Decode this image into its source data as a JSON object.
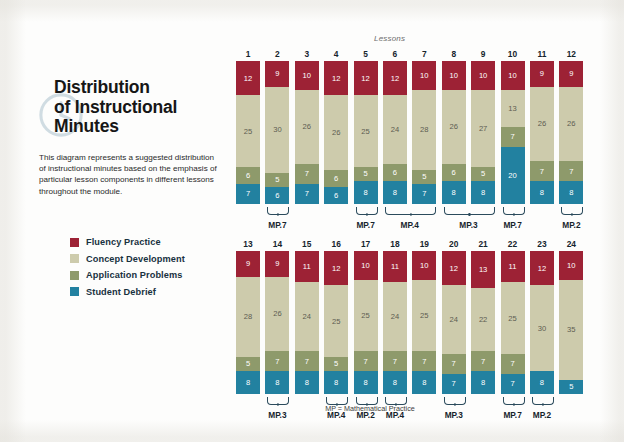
{
  "header": {
    "title_lines": [
      "Distribution",
      "of Instructional",
      "Minutes"
    ],
    "intro": "This diagram represents a suggested distribution of instructional minutes based on the emphasis of particular lesson components in different lessons throughout the module.",
    "clock_icon": "clock-icon"
  },
  "legend": {
    "items": [
      {
        "label": "Fluency Practice",
        "color": "#9d2235"
      },
      {
        "label": "Concept Development",
        "color": "#cdcbac"
      },
      {
        "label": "Application Problems",
        "color": "#8e9a6b"
      },
      {
        "label": "Student Debrief",
        "color": "#2281a0"
      }
    ]
  },
  "chart_data": {
    "type": "bar",
    "title": "Distribution of Instructional Minutes",
    "subtitle": "Lessons",
    "stacked": true,
    "xlabel": "Lessons",
    "ylabel": "Instructional minutes",
    "ylim": [
      0,
      50
    ],
    "grid": false,
    "legend_position": "left",
    "categories": [
      "1",
      "2",
      "3",
      "4",
      "5",
      "6",
      "7",
      "8",
      "9",
      "10",
      "11",
      "12",
      "13",
      "14",
      "15",
      "16",
      "17",
      "18",
      "19",
      "20",
      "21",
      "22",
      "23",
      "24"
    ],
    "series": [
      {
        "name": "Fluency Practice",
        "color": "#9d2235",
        "values": [
          12,
          9,
          10,
          12,
          12,
          12,
          10,
          10,
          10,
          10,
          9,
          9,
          9,
          9,
          11,
          12,
          10,
          11,
          10,
          12,
          13,
          11,
          12,
          10
        ]
      },
      {
        "name": "Concept Development",
        "color": "#cdcbac",
        "values": [
          25,
          30,
          26,
          26,
          25,
          24,
          28,
          26,
          27,
          13,
          26,
          26,
          28,
          26,
          24,
          25,
          25,
          24,
          25,
          24,
          22,
          25,
          30,
          35
        ]
      },
      {
        "name": "Application Problems",
        "color": "#8e9a6b",
        "values": [
          6,
          5,
          7,
          6,
          5,
          6,
          5,
          6,
          5,
          7,
          7,
          7,
          5,
          7,
          7,
          5,
          7,
          7,
          7,
          7,
          7,
          7,
          0,
          0
        ]
      },
      {
        "name": "Student Debrief",
        "color": "#2281a0",
        "values": [
          7,
          6,
          7,
          6,
          8,
          8,
          7,
          8,
          8,
          20,
          8,
          8,
          8,
          8,
          8,
          8,
          8,
          8,
          8,
          7,
          8,
          7,
          8,
          5
        ]
      }
    ],
    "annotations": [
      {
        "label": "MP.7",
        "lessons": [
          "2"
        ]
      },
      {
        "label": "MP.7",
        "lessons": [
          "5"
        ]
      },
      {
        "label": "MP.4",
        "lessons": [
          "6",
          "7"
        ]
      },
      {
        "label": "MP.3",
        "lessons": [
          "8",
          "9"
        ]
      },
      {
        "label": "MP.7",
        "lessons": [
          "10"
        ]
      },
      {
        "label": "MP.2",
        "lessons": [
          "12"
        ]
      },
      {
        "label": "MP.3",
        "lessons": [
          "14"
        ]
      },
      {
        "label": "MP.4",
        "lessons": [
          "16"
        ]
      },
      {
        "label": "MP.2",
        "lessons": [
          "17"
        ]
      },
      {
        "label": "MP.4",
        "lessons": [
          "18"
        ]
      },
      {
        "label": "MP.3",
        "lessons": [
          "20"
        ]
      },
      {
        "label": "MP.7",
        "lessons": [
          "22"
        ]
      },
      {
        "label": "MP.2",
        "lessons": [
          "23"
        ]
      }
    ]
  },
  "rows": [
    {
      "lessons": [
        "1",
        "2",
        "3",
        "4",
        "5",
        "6",
        "7",
        "8",
        "9",
        "10",
        "11",
        "12"
      ]
    },
    {
      "lessons": [
        "13",
        "14",
        "15",
        "16",
        "17",
        "18",
        "19",
        "20",
        "21",
        "22",
        "23",
        "24"
      ]
    }
  ],
  "labels": {
    "lessons_caption": "Lessons",
    "footnote": "MP = Mathematical Practice"
  }
}
